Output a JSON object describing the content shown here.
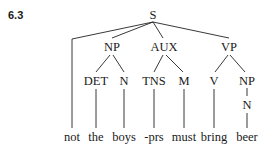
{
  "example_number": "6.3",
  "tree": {
    "root": "S",
    "nodes": {
      "S": "S",
      "NP": "NP",
      "AUX": "AUX",
      "VP": "VP",
      "DET": "DET",
      "N1": "N",
      "TNS": "TNS",
      "M": "M",
      "V": "V",
      "NP2": "NP",
      "N2": "N"
    },
    "words": [
      "not",
      "the",
      "boys",
      "-prs",
      "must",
      "bring",
      "beer"
    ],
    "structure": "[S not [NP [DET the] [N boys]] [AUX [TNS -prs] [M must]] [VP [V bring] [NP [N beer]]]]"
  }
}
